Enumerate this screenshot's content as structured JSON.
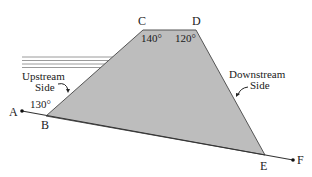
{
  "diagram": {
    "points": {
      "A": {
        "label": "A"
      },
      "B": {
        "label": "B"
      },
      "C": {
        "label": "C"
      },
      "D": {
        "label": "D"
      },
      "E": {
        "label": "E"
      },
      "F": {
        "label": "F"
      }
    },
    "angles": {
      "B": "130°",
      "C": "140°",
      "D": "120°"
    },
    "sides": {
      "upstream_line1": "Upstream",
      "upstream_line2": "Side",
      "downstream_line1": "Downstream",
      "downstream_line2": "Side"
    },
    "colors": {
      "dam_fill": "#bdbdbd",
      "stroke": "#333333",
      "water_lines": "#9a9a9a"
    }
  }
}
